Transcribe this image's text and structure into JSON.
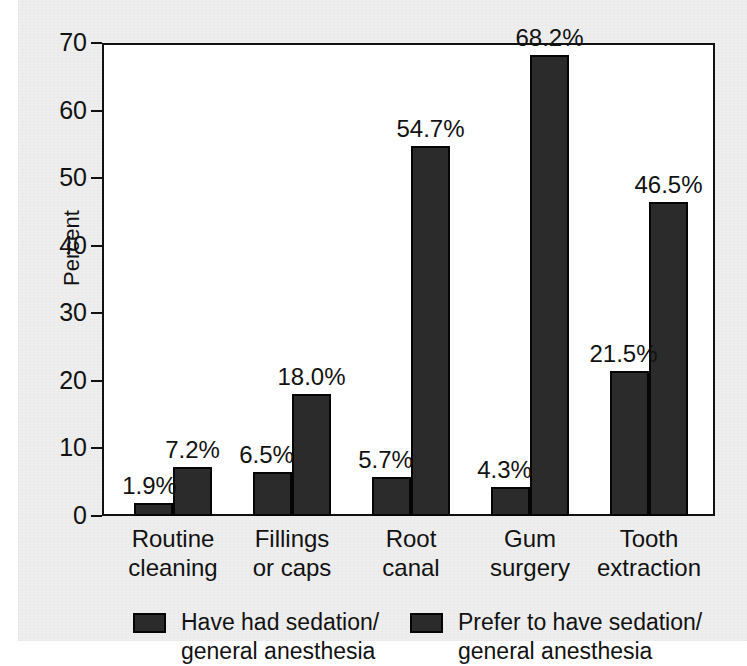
{
  "chart_data": {
    "type": "bar",
    "title": "",
    "subtitle": "",
    "xlabel": "",
    "ylabel": "Percent",
    "ylim": [
      0,
      70
    ],
    "yticks": [
      0,
      10,
      20,
      30,
      40,
      50,
      60,
      70
    ],
    "ytick_labels": [
      "0",
      "10",
      "20",
      "30",
      "40",
      "50",
      "60",
      "70"
    ],
    "grid": false,
    "legend_position": "bottom",
    "categories": [
      "Routine\ncleaning",
      "Fillings\nor caps",
      "Root\ncanal",
      "Gum\nsurgery",
      "Tooth\nextraction"
    ],
    "series": [
      {
        "name": "Have had sedation/\ngeneral anesthesia",
        "color": "#2b2b2b",
        "values": [
          1.9,
          6.5,
          5.7,
          4.3,
          21.5
        ],
        "labels": [
          "1.9%",
          "6.5%",
          "5.7%",
          "4.3%",
          "21.5%"
        ]
      },
      {
        "name": "Prefer to have sedation/\ngeneral anesthesia",
        "color": "#2b2b2b",
        "values": [
          7.2,
          18.0,
          54.7,
          68.2,
          46.5
        ],
        "labels": [
          "7.2%",
          "18.0%",
          "54.7%",
          "68.2%",
          "46.5%"
        ]
      }
    ]
  },
  "axis": {
    "y_title": "Percent",
    "ticks": [
      {
        "label": "70",
        "value": 70
      },
      {
        "label": "60",
        "value": 60
      },
      {
        "label": "50",
        "value": 50
      },
      {
        "label": "40",
        "value": 40
      },
      {
        "label": "30",
        "value": 30
      },
      {
        "label": "20",
        "value": 20
      },
      {
        "label": "10",
        "value": 10
      },
      {
        "label": "0",
        "value": 0
      }
    ]
  },
  "groups": [
    {
      "line1": "Routine",
      "line2": "cleaning"
    },
    {
      "line1": "Fillings",
      "line2": "or caps"
    },
    {
      "line1": "Root",
      "line2": "canal"
    },
    {
      "line1": "Gum",
      "line2": "surgery"
    },
    {
      "line1": "Tooth",
      "line2": "extraction"
    }
  ],
  "legend": {
    "items": [
      {
        "label": "Have had sedation/\ngeneral anesthesia",
        "color": "#2b2b2b"
      },
      {
        "label": "Prefer to have sedation/\ngeneral anesthesia",
        "color": "#2b2b2b"
      }
    ]
  },
  "colors": {
    "bar_fill": "#2b2b2b",
    "bar_stroke": "#050505",
    "plot_background": "#ffffff",
    "page_background": "#eeeeee",
    "text": "#121212"
  }
}
